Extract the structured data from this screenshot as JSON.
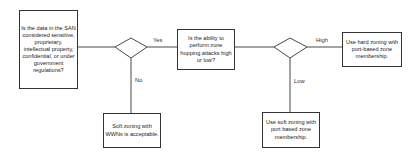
{
  "nodes": {
    "q1": "Is the data in the SAN considered sensitive, proprietary, intellectual property, confidential, or under government regulations?",
    "q2": "Is the ability to perform zone hopping attacks high or low?",
    "high_result": "Use hard zoning with port-based zone membership.",
    "low_result": "Use soft zoning with port based zone membership.",
    "no_result": "Soft zoning with WWNs is acceptable."
  },
  "edges": {
    "yes": "Yes",
    "no": "No",
    "high": "High",
    "low": "Low"
  }
}
